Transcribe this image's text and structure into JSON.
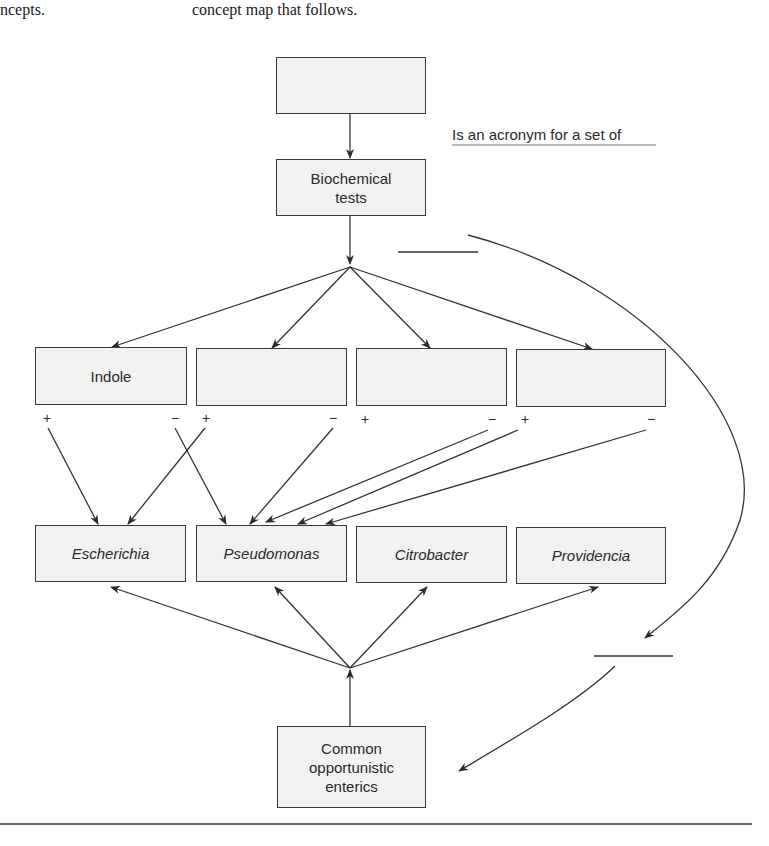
{
  "header_text": {
    "left": "ncepts.",
    "right": "concept map that follows."
  },
  "concept_map": {
    "top_box": {
      "label": ""
    },
    "biochemical_box": {
      "label_line1": "Biochemical",
      "label_line2": "tests"
    },
    "linking_phrase": "Is an acronym for a set of",
    "tests": [
      {
        "label": "Indole",
        "plus": "+",
        "minus": "−"
      },
      {
        "label": "",
        "plus": "+",
        "minus": "−"
      },
      {
        "label": "",
        "plus": "+",
        "minus": "−"
      },
      {
        "label": "",
        "plus": "+",
        "minus": "−"
      }
    ],
    "genera": [
      {
        "label": "Escherichia"
      },
      {
        "label": "Pseudomonas"
      },
      {
        "label": "Citrobacter"
      },
      {
        "label": "Providencia"
      }
    ],
    "bottom_box": {
      "label_line1": "Common",
      "label_line2": "opportunistic",
      "label_line3": "enterics"
    },
    "blank_linking_phrases": [
      "",
      ""
    ]
  }
}
